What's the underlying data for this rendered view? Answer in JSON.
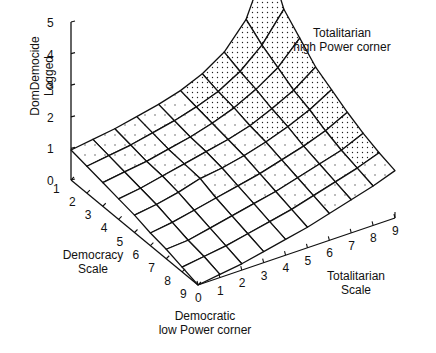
{
  "chart_data": {
    "type": "surface3d",
    "title": "",
    "zlabel": "DomDemocide Logged",
    "xlabel": "Democracy Scale",
    "ylabel": "Totalitarian Scale",
    "zlim": [
      0,
      5
    ],
    "z_ticks": [
      "0",
      "1",
      "2",
      "3",
      "4",
      "5"
    ],
    "democracy_ticks": [
      "1",
      "2",
      "3",
      "4",
      "5",
      "6",
      "7",
      "8",
      "9"
    ],
    "totalitarian_ticks": [
      "0",
      "1",
      "2",
      "3",
      "4",
      "5",
      "6",
      "7",
      "8",
      "9"
    ],
    "annotations": [
      {
        "text": "Totalitarian high Power corner",
        "position": "top-right"
      },
      {
        "text": "Democratic low Power corner",
        "position": "bottom-front"
      }
    ],
    "democracy": [
      1,
      2,
      3,
      4,
      5,
      6,
      7,
      8,
      9
    ],
    "totalitarian": [
      0,
      1,
      2,
      3,
      4,
      5,
      6,
      7,
      8,
      9
    ],
    "z_rows_by_democracy": [
      [
        0.95,
        1.05,
        1.15,
        1.3,
        1.45,
        1.65,
        1.95,
        2.4,
        3.2,
        4.9
      ],
      [
        0.85,
        0.95,
        1.05,
        1.2,
        1.35,
        1.55,
        1.8,
        2.2,
        2.8,
        3.7
      ],
      [
        0.75,
        0.85,
        0.95,
        1.1,
        1.25,
        1.45,
        1.7,
        2.05,
        2.5,
        3.2
      ],
      [
        0.65,
        0.75,
        0.9,
        1.05,
        1.2,
        1.35,
        1.55,
        1.85,
        2.2,
        2.7
      ],
      [
        0.55,
        0.65,
        0.8,
        1.0,
        1.1,
        1.25,
        1.45,
        1.7,
        2.0,
        2.4
      ],
      [
        0.4,
        0.5,
        0.65,
        0.8,
        0.95,
        1.1,
        1.3,
        1.5,
        1.75,
        2.1
      ],
      [
        0.3,
        0.35,
        0.5,
        0.65,
        0.8,
        0.95,
        1.15,
        1.35,
        1.55,
        1.85
      ],
      [
        0.15,
        0.25,
        0.35,
        0.5,
        0.65,
        0.8,
        1.0,
        1.2,
        1.4,
        1.65
      ],
      [
        0.0,
        0.1,
        0.2,
        0.35,
        0.5,
        0.65,
        0.85,
        1.05,
        1.25,
        1.5
      ]
    ],
    "grid": false,
    "legend": "none"
  },
  "labels": {
    "zlabel_line1": "DomDemocide",
    "zlabel_line2": "Logged",
    "corner_top_line1": "Totalitarian",
    "corner_top_line2": "high Power corner",
    "corner_bottom_line1": "Democratic",
    "corner_bottom_line2": "low Power corner",
    "dem_line1": "Democracy",
    "dem_line2": "Scale",
    "tot_line1": "Totalitarian",
    "tot_line2": "Scale"
  }
}
